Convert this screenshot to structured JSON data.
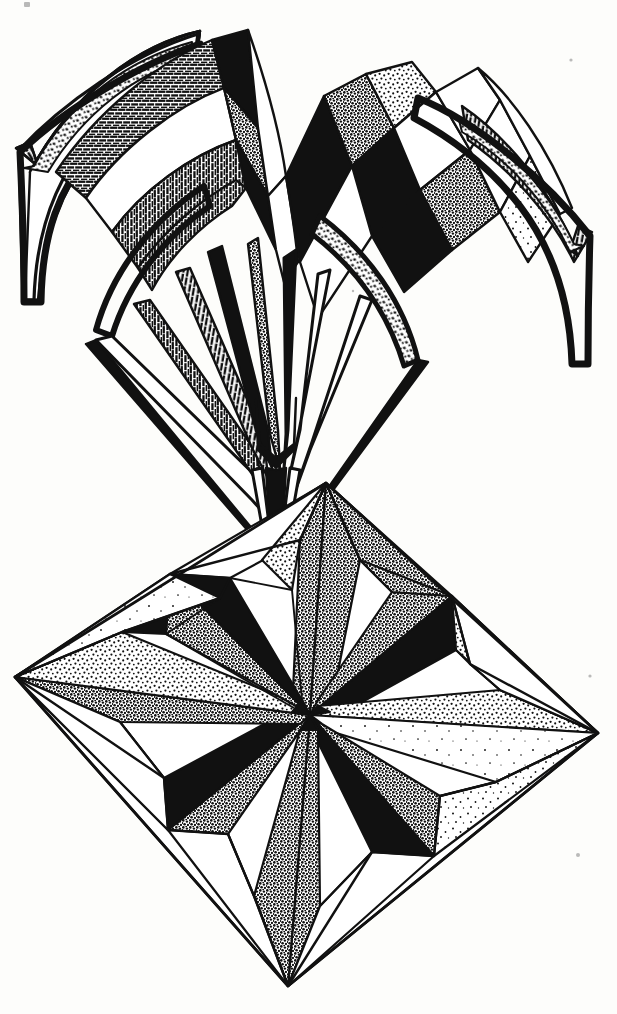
{
  "artwork": {
    "title": "Two-Part Faceted Geometric Study",
    "medium": "pen and ink line drawing",
    "technique": "hatching, cross-hatching, stippling, solid fill",
    "background_color": "#fdfdfb",
    "ink_color": "#111111",
    "canvas": {
      "width": 617,
      "height": 1014
    },
    "text_present": "none",
    "figures": [
      {
        "id": "upper-crown",
        "name": "Arched vaulted crown",
        "description": "Four ribbed arches splaying outward from a narrow central throat, each arch ending in a hooked barbed tip; the crown above is a fan of zigzag peaked facets.",
        "bounds": {
          "x": 10,
          "y": 18,
          "width": 590,
          "height": 530
        },
        "apex": {
          "x": 248,
          "y": 30
        },
        "throat_point": {
          "x": 275,
          "y": 540
        },
        "left_tip": {
          "x": 16,
          "y": 148
        },
        "right_tip": {
          "x": 592,
          "y": 232
        },
        "fills": [
          "solid-black",
          "dash-hatch",
          "stipple-dense",
          "stipple-sparse",
          "white"
        ]
      },
      {
        "id": "lower-star",
        "name": "Rhombic eight-point star",
        "description": "A rhombus frame enclosing an eight-pointed star of alternating solid black and stippled facets radiating from a pinwheel centre.",
        "bounds": {
          "x": 15,
          "y": 483,
          "width": 583,
          "height": 503
        },
        "vertices": {
          "top": {
            "x": 326,
            "y": 483
          },
          "left": {
            "x": 15,
            "y": 677
          },
          "right": {
            "x": 598,
            "y": 733
          },
          "bottom": {
            "x": 288,
            "y": 986
          }
        },
        "centre": {
          "x": 310,
          "y": 715
        },
        "star_points": 8,
        "fills": [
          "solid-black",
          "stipple-dense",
          "stipple-medium",
          "stipple-sparse",
          "white"
        ]
      }
    ],
    "marks": [
      {
        "name": "corner-speck-top-left",
        "x": 25,
        "y": 3
      },
      {
        "name": "speck-upper-right",
        "x": 571,
        "y": 60
      },
      {
        "name": "speck-mid-right",
        "x": 590,
        "y": 676
      },
      {
        "name": "speck-lower-right",
        "x": 578,
        "y": 855
      }
    ]
  }
}
